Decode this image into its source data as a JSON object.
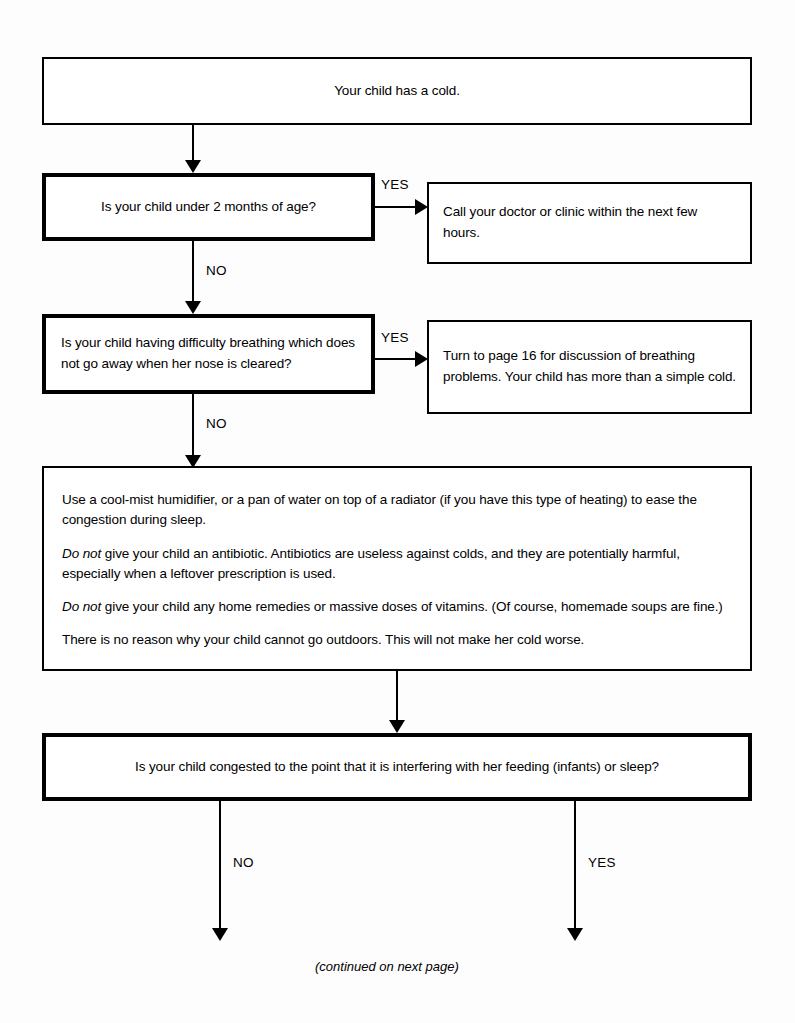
{
  "flowchart": {
    "title_node": {
      "text": "Your child has a cold."
    },
    "decisions": [
      {
        "id": "under-2-months",
        "question": "Is your child under 2 months of age?",
        "yes_label": "YES",
        "no_label": "NO"
      },
      {
        "id": "difficulty-breathing",
        "question": "Is your child having difficulty breathing which does not go away when her nose is cleared?",
        "yes_label": "YES",
        "no_label": "NO"
      },
      {
        "id": "congestion-interfering",
        "question": "Is your child congested to the point that it is interfering with her feeding (infants) or sleep?",
        "yes_label": "YES",
        "no_label": "NO"
      }
    ],
    "outcomes": [
      {
        "id": "call-doctor",
        "text": "Call your doctor or clinic within the next few hours."
      },
      {
        "id": "turn-to-page-16",
        "text": "Turn to page 16 for discussion of breathing problems. Your child has more than a simple cold."
      }
    ],
    "advice": {
      "id": "home-care-advice",
      "paragraphs": [
        {
          "emphasis": "",
          "text": "Use a cool-mist humidifier, or a pan of water on top of a radiator (if you have this type of heating) to ease the congestion during sleep."
        },
        {
          "emphasis": "Do not",
          "text": " give your child an antibiotic. Antibiotics are useless against colds, and they are potentially harmful, especially when a leftover prescription is used."
        },
        {
          "emphasis": "Do not",
          "text": " give your child any home remedies or massive doses of vitamins. (Of course, homemade soups are fine.)"
        },
        {
          "emphasis": "",
          "text": "There is no reason why your child cannot go outdoors. This will not make her cold worse."
        }
      ]
    },
    "footer": {
      "continued_note": "(continued on next page)"
    }
  },
  "colors": {
    "ink": "#000000",
    "page": "#fdfdfd"
  }
}
